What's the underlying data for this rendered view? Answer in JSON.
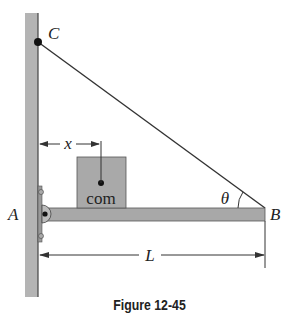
{
  "figure": {
    "caption": "Figure 12-45",
    "labels": {
      "point_c": "C",
      "point_a": "A",
      "point_b": "B",
      "distance_x": "x",
      "length_l": "L",
      "angle": "θ",
      "block": "com"
    },
    "colors": {
      "wall": "#b4b4b4",
      "beam": "#a8a8a8",
      "block": "#a9a9a9",
      "line": "#333333"
    }
  }
}
